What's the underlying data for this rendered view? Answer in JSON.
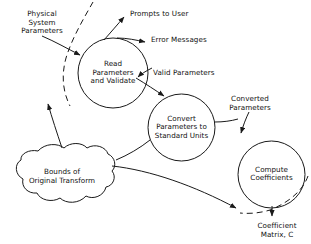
{
  "diagram": {
    "type": "data-flow-diagram",
    "stroke_color": "#1a1a1a",
    "text_color": "#111111",
    "background": "#ffffff",
    "processes": [
      {
        "id": "read",
        "label": "Read\nParameters\nand Validate",
        "cx": 113,
        "cy": 73,
        "r": 35
      },
      {
        "id": "convert",
        "label": "Convert\nParameters to\nStandard Units",
        "cx": 181.5,
        "cy": 127.5,
        "r": 33.5
      },
      {
        "id": "compute",
        "label": "Compute\nCoefficients",
        "cx": 271.5,
        "cy": 174.5,
        "r": 33.5
      }
    ],
    "stores": [
      {
        "id": "bounds",
        "label": "Bounds of\nOriginal Transform",
        "cx": 62,
        "cy": 177
      }
    ],
    "flows": [
      {
        "id": "physical-system-parameters",
        "label": "Physical\nSystem\nParameters",
        "x": 42,
        "y": 10,
        "align": "center"
      },
      {
        "id": "prompts-to-user",
        "label": "Prompts to User",
        "x": 130,
        "y": 10,
        "align": "left"
      },
      {
        "id": "error-messages",
        "label": "Error Messages",
        "x": 151,
        "y": 36,
        "align": "left"
      },
      {
        "id": "valid-parameters",
        "label": "Valid Parameters",
        "x": 153,
        "y": 69,
        "align": "left"
      },
      {
        "id": "converted-parameters",
        "label": "Converted\nParameters",
        "x": 250,
        "y": 95,
        "align": "center"
      },
      {
        "id": "coefficient-matrix",
        "label": "Coefficient\nMatrix, C",
        "x": 277,
        "y": 222,
        "align": "center"
      }
    ]
  }
}
